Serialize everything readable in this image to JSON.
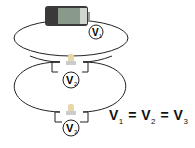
{
  "diagram": {
    "battery": {
      "label": "battery"
    },
    "meters": [
      {
        "symbol": "V",
        "subscript": "1"
      },
      {
        "symbol": "V",
        "subscript": "2"
      },
      {
        "symbol": "V",
        "subscript": "3"
      }
    ],
    "equation": {
      "terms": [
        {
          "symbol": "V",
          "subscript": "1"
        },
        {
          "symbol": "V",
          "subscript": "2"
        },
        {
          "symbol": "V",
          "subscript": "3"
        }
      ],
      "operator": "="
    },
    "colors": {
      "wire": "#222222",
      "battery_dark": "#3a3a3a",
      "battery_label": "#8a9a8a",
      "bulb": "#e8d8a8"
    }
  }
}
